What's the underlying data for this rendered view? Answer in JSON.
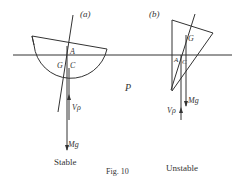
{
  "figure": {
    "caption": "Fig. 10",
    "panels": [
      {
        "id": "a",
        "tag": "(a)",
        "title": "Stable",
        "points": {
          "A": "A",
          "G": "G",
          "C": "C"
        },
        "forces": {
          "buoyancy": "Vρ",
          "weight": "Mg"
        }
      },
      {
        "id": "b",
        "tag": "(b)",
        "title": "Unstable",
        "points": {
          "A": "A",
          "G": "G",
          "C": "C"
        },
        "forces": {
          "buoyancy": "Vρ",
          "weight": "Mg"
        }
      }
    ],
    "plane_label": "P"
  }
}
